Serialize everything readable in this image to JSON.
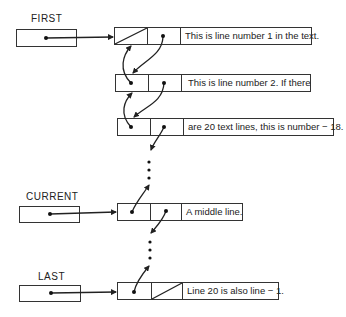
{
  "pointers": {
    "first": {
      "label": "FIRST"
    },
    "current": {
      "label": "CURRENT"
    },
    "last": {
      "label": "LAST"
    }
  },
  "nodes": [
    {
      "text": "This is line number 1 in the text.",
      "prev": "null",
      "next": "pointer"
    },
    {
      "text": "This is line number 2.  If there",
      "prev": "pointer",
      "next": "pointer"
    },
    {
      "text": "are 20 text lines, this is number − 18.",
      "prev": "pointer",
      "next": "pointer"
    },
    {
      "text": "A middle line.",
      "prev": "pointer",
      "next": "pointer"
    },
    {
      "text": "Line 20 is also line − 1.",
      "prev": "pointer",
      "next": "null"
    }
  ],
  "ellipsis": [
    "•",
    "•",
    "•"
  ]
}
